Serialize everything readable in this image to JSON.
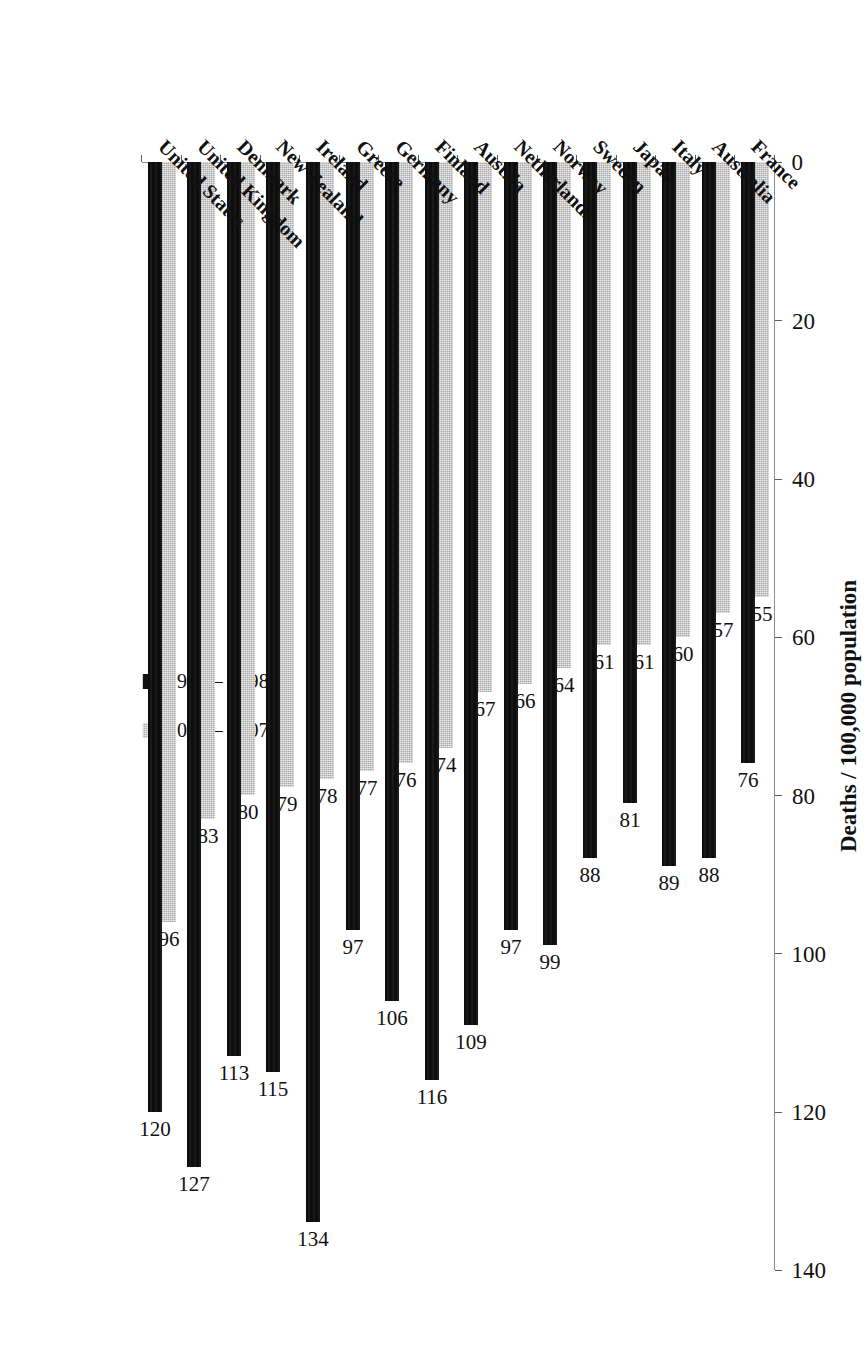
{
  "chart_data": {
    "type": "bar",
    "title": "",
    "subtitle": "",
    "orientation": "vertical",
    "xlabel": "",
    "ylabel": "Deaths / 100,000 population",
    "ylim": [
      0,
      140
    ],
    "yticks": [
      0,
      20,
      40,
      60,
      80,
      100,
      120,
      140
    ],
    "ytick_labels": [
      "0",
      "20",
      "40",
      "60",
      "80",
      "100",
      "120",
      "140"
    ],
    "grid": false,
    "legend_position": "top-left",
    "categories": [
      "France",
      "Australia",
      "Italy",
      "Japan",
      "Sweden",
      "Norway",
      "Netherlands",
      "Austria",
      "Finland",
      "Germany",
      "Greece",
      "Ireland",
      "New Zealand",
      "Denmark",
      "United Kingdom",
      "United States"
    ],
    "series": [
      {
        "name": "1997 – 1998",
        "color": "#0d0d0d",
        "values": [
          76,
          88,
          89,
          81,
          88,
          99,
          97,
          109,
          116,
          106,
          97,
          134,
          115,
          113,
          127,
          120
        ]
      },
      {
        "name": "2006 – 2007",
        "color": "#a9a9a9",
        "values": [
          55,
          57,
          60,
          61,
          61,
          64,
          66,
          67,
          74,
          76,
          77,
          78,
          79,
          80,
          83,
          96
        ]
      }
    ]
  },
  "legend": {
    "entries": [
      {
        "label": "1997 – 1998",
        "swatch": "black-square-marker"
      },
      {
        "label": "2006 – 2007",
        "swatch": "gray-square-marker"
      }
    ]
  },
  "axes": {
    "value_axis_title": "Deaths / 100,000 population",
    "value_tick_labels": [
      "0",
      "20",
      "40",
      "60",
      "80",
      "100",
      "120",
      "140"
    ]
  }
}
